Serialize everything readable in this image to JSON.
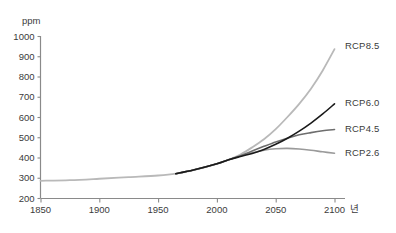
{
  "chart_data": {
    "type": "line",
    "title": "",
    "subtitle": "",
    "xlabel": "년",
    "ylabel": "ppm",
    "xlim": [
      1850,
      2100
    ],
    "ylim": [
      200,
      1000
    ],
    "xticks": [
      1850,
      1900,
      1950,
      2000,
      2050,
      2100
    ],
    "yticks": [
      200,
      300,
      400,
      500,
      600,
      700,
      800,
      900,
      1000
    ],
    "grid": false,
    "legend_position": "right-of-plot",
    "series": [
      {
        "name": "RCP8.5",
        "color": "#b9b9b9",
        "width": 1.8,
        "x": [
          1850,
          1875,
          1900,
          1925,
          1950,
          1965,
          1980,
          2000,
          2010,
          2020,
          2030,
          2040,
          2050,
          2060,
          2070,
          2080,
          2090,
          2100
        ],
        "y": [
          285,
          288,
          295,
          303,
          311,
          320,
          338,
          369,
          389,
          415,
          450,
          490,
          540,
          600,
          665,
          740,
          830,
          935
        ]
      },
      {
        "name": "RCP6.0",
        "color": "#1a1a1a",
        "width": 1.6,
        "x": [
          1965,
          1980,
          2000,
          2010,
          2020,
          2030,
          2040,
          2050,
          2060,
          2070,
          2080,
          2090,
          2100
        ],
        "y": [
          320,
          338,
          369,
          389,
          405,
          420,
          440,
          465,
          495,
          530,
          570,
          615,
          665
        ]
      },
      {
        "name": "RCP4.5",
        "color": "#6e6e6e",
        "width": 1.6,
        "x": [
          1965,
          1980,
          2000,
          2010,
          2020,
          2030,
          2040,
          2050,
          2060,
          2070,
          2080,
          2090,
          2100
        ],
        "y": [
          320,
          338,
          369,
          389,
          409,
          432,
          455,
          477,
          495,
          512,
          523,
          532,
          538
        ]
      },
      {
        "name": "RCP2.6",
        "color": "#9a9a9a",
        "width": 1.6,
        "x": [
          1965,
          1980,
          2000,
          2010,
          2020,
          2030,
          2040,
          2050,
          2060,
          2070,
          2080,
          2090,
          2100
        ],
        "y": [
          320,
          338,
          369,
          389,
          407,
          423,
          436,
          443,
          445,
          442,
          436,
          428,
          421
        ]
      }
    ],
    "legend": [
      {
        "label": "RCP8.5",
        "color": "#b9b9b9",
        "y": 46
      },
      {
        "label": "RCP6.0",
        "color": "#1a1a1a",
        "y": 103
      },
      {
        "label": "RCP4.5",
        "color": "#6e6e6e",
        "y": 129
      },
      {
        "label": "RCP2.6",
        "color": "#9a9a9a",
        "y": 153
      }
    ]
  },
  "axes": {
    "y_unit": "ppm",
    "x_unit": "년",
    "y_tick_labels": [
      "1000",
      "900",
      "800",
      "700",
      "600",
      "500",
      "400",
      "300",
      "200"
    ],
    "x_tick_labels": [
      "1850",
      "1900",
      "1950",
      "2000",
      "2050",
      "2100"
    ]
  }
}
